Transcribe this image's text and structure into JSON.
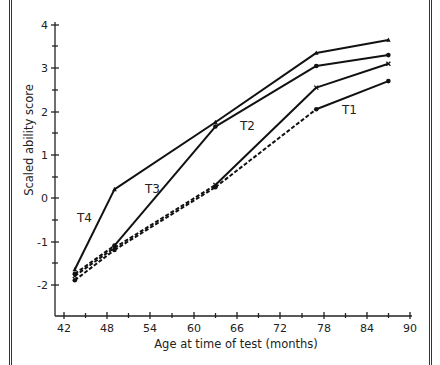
{
  "chart_data": {
    "type": "line",
    "title": "",
    "xlabel": "Age at time of test (months)",
    "ylabel": "Scaled ability score",
    "xlim": [
      41,
      91
    ],
    "ylim": [
      -2.6,
      4.1
    ],
    "x_ticks": [
      42,
      48,
      54,
      60,
      66,
      72,
      78,
      84,
      90
    ],
    "y_ticks": [
      -2,
      -1,
      0,
      1,
      2,
      3,
      4
    ],
    "grid": false,
    "legend": "inline labels",
    "x": [
      43.5,
      49,
      63,
      77,
      87
    ],
    "series": [
      {
        "name": "T4",
        "marker": "triangle",
        "values": [
          -1.65,
          0.2,
          1.75,
          3.35,
          3.65
        ],
        "dashed_segments": []
      },
      {
        "name": "T3",
        "marker": "dot",
        "values": [
          -1.75,
          -1.1,
          1.65,
          3.05,
          3.3
        ],
        "dashed_segments": [
          0
        ]
      },
      {
        "name": "T2",
        "marker": "x",
        "values": [
          -1.8,
          -1.15,
          0.3,
          2.55,
          3.1
        ],
        "dashed_segments": [
          0,
          1
        ]
      },
      {
        "name": "T1",
        "marker": "dot",
        "values": [
          -1.9,
          -1.2,
          0.25,
          2.05,
          2.7
        ],
        "dashed_segments": [
          0,
          1,
          2
        ]
      }
    ],
    "annotations": [
      {
        "text": "T4",
        "x": 45.3,
        "y": -0.45
      },
      {
        "text": "T3",
        "x": 54.8,
        "y": 0.25
      },
      {
        "text": "T2",
        "x": 70.5,
        "y": 1.7
      },
      {
        "text": "T1",
        "x": 81,
        "y": 1.85
      }
    ]
  },
  "labels": {
    "xlabel": "Age at time of test (months)",
    "ylabel": "Scaled ability score",
    "x_ticks": [
      "42",
      "48",
      "54",
      "60",
      "66",
      "72",
      "78",
      "84",
      "90"
    ],
    "y_ticks": [
      "4",
      "3",
      "2",
      "1",
      "0",
      "-1",
      "-2"
    ],
    "series": [
      "T4",
      "T3",
      "T2",
      "T1"
    ]
  }
}
